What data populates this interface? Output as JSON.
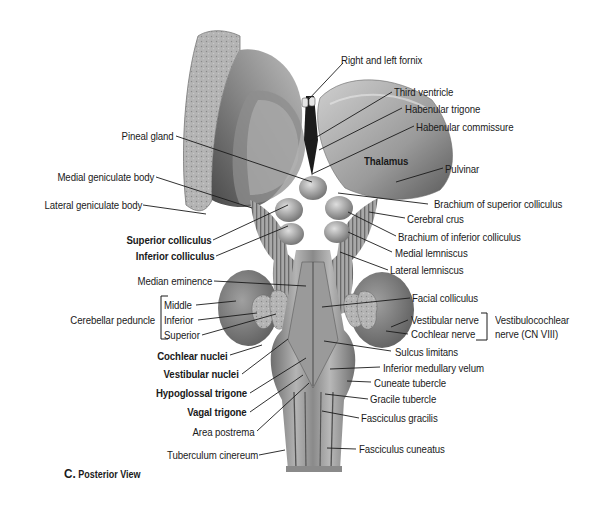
{
  "figure": {
    "caption_letter": "C.",
    "caption_text": "Posterior View"
  },
  "labels_left": {
    "pineal_gland": "Pineal gland",
    "medial_geniculate_body": "Medial geniculate body",
    "lateral_geniculate_body": "Lateral geniculate body",
    "superior_colliculus": "Superior colliculus",
    "inferior_colliculus": "Inferior colliculus",
    "median_eminence": "Median eminence",
    "cerebellar_peduncle": "Cerebellar peduncle",
    "peduncle_middle": "Middle",
    "peduncle_inferior": "Inferior",
    "peduncle_superior": "Superior",
    "cochlear_nuclei": "Cochlear nuclei",
    "vestibular_nuclei": "Vestibular nuclei",
    "hypoglossal_trigone": "Hypoglossal trigone",
    "vagal_trigone": "Vagal trigone",
    "area_postrema": "Area postrema",
    "tuberculum_cinereum": "Tuberculum cinereum"
  },
  "labels_right": {
    "right_left_fornix": "Right and left fornix",
    "third_ventricle": "Third ventricle",
    "habenular_trigone": "Habenular trigone",
    "habenular_commissure": "Habenular commissure",
    "thalamus": "Thalamus",
    "pulvinar": "Pulvinar",
    "brachium_superior_colliculus": "Brachium of superior colliculus",
    "cerebral_crus": "Cerebral crus",
    "brachium_inferior_colliculus": "Brachium of inferior colliculus",
    "medial_lemniscus": "Medial lemniscus",
    "lateral_lemniscus": "Lateral lemniscus",
    "facial_colliculus": "Facial colliculus",
    "vestibular_nerve": "Vestibular nerve",
    "cochlear_nerve": "Cochlear nerve",
    "vestibulocochlear_line1": "Vestibulocochlear",
    "vestibulocochlear_line2": "nerve (CN VIII)",
    "sulcus_limitans": "Sulcus limitans",
    "inferior_medullary_velum": "Inferior medullary velum",
    "cuneate_tubercle": "Cuneate tubercle",
    "gracile_tubercle": "Gracile tubercle",
    "fasciculus_gracilis": "Fasciculus gracilis",
    "fasciculus_cuneatus": "Fasciculus cuneatus"
  }
}
